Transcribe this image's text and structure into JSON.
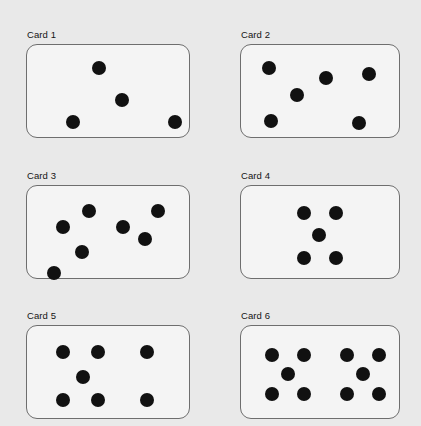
{
  "page": {
    "background_color": "#e9e9e9",
    "card_fill_color": "#f4f4f4",
    "card_border_color": "#6e6e6e",
    "dot_color": "#111111",
    "width": 421,
    "height": 426
  },
  "chart_data": {
    "type": "scatter",
    "title": "",
    "subtitle": "",
    "xlabel": "",
    "ylabel": "",
    "grid": false,
    "legend": null,
    "categories": [
      "Card 1",
      "Card 2",
      "Card 3",
      "Card 4",
      "Card 5",
      "Card 6"
    ],
    "values": [
      4,
      6,
      7,
      5,
      7,
      10
    ],
    "series": [
      {
        "name": "dot count per card",
        "values": [
          4,
          6,
          7,
          5,
          7,
          10
        ]
      }
    ],
    "dot_radius_px": 7
  },
  "cards": [
    {
      "label": "Card 1",
      "dot_count": 4,
      "box": {
        "x": 26,
        "y": 29,
        "w": 164,
        "h": 94
      },
      "dots": [
        {
          "cx": 72,
          "cy": 23
        },
        {
          "cx": 95,
          "cy": 55
        },
        {
          "cx": 46,
          "cy": 77
        },
        {
          "cx": 148,
          "cy": 77
        }
      ]
    },
    {
      "label": "Card 2",
      "dot_count": 6,
      "box": {
        "x": 240,
        "y": 29,
        "w": 160,
        "h": 94
      },
      "dots": [
        {
          "cx": 28,
          "cy": 23
        },
        {
          "cx": 56,
          "cy": 50
        },
        {
          "cx": 85,
          "cy": 33
        },
        {
          "cx": 128,
          "cy": 29
        },
        {
          "cx": 30,
          "cy": 76
        },
        {
          "cx": 118,
          "cy": 78
        }
      ]
    },
    {
      "label": "Card 3",
      "dot_count": 7,
      "box": {
        "x": 26,
        "y": 170,
        "w": 164,
        "h": 94
      },
      "dots": [
        {
          "cx": 62,
          "cy": 25
        },
        {
          "cx": 36,
          "cy": 41
        },
        {
          "cx": 55,
          "cy": 66
        },
        {
          "cx": 27,
          "cy": 87
        },
        {
          "cx": 96,
          "cy": 41
        },
        {
          "cx": 118,
          "cy": 53
        },
        {
          "cx": 131,
          "cy": 25
        }
      ]
    },
    {
      "label": "Card 4",
      "dot_count": 5,
      "box": {
        "x": 240,
        "y": 170,
        "w": 160,
        "h": 94
      },
      "dots": [
        {
          "cx": 63,
          "cy": 27
        },
        {
          "cx": 95,
          "cy": 27
        },
        {
          "cx": 78,
          "cy": 49
        },
        {
          "cx": 63,
          "cy": 72
        },
        {
          "cx": 95,
          "cy": 72
        }
      ]
    },
    {
      "label": "Card 5",
      "dot_count": 7,
      "box": {
        "x": 26,
        "y": 310,
        "w": 164,
        "h": 94
      },
      "dots": [
        {
          "cx": 36,
          "cy": 26
        },
        {
          "cx": 71,
          "cy": 26
        },
        {
          "cx": 120,
          "cy": 26
        },
        {
          "cx": 56,
          "cy": 51
        },
        {
          "cx": 36,
          "cy": 74
        },
        {
          "cx": 71,
          "cy": 74
        },
        {
          "cx": 120,
          "cy": 74
        }
      ]
    },
    {
      "label": "Card 6",
      "dot_count": 10,
      "box": {
        "x": 240,
        "y": 310,
        "w": 160,
        "h": 94
      },
      "dots": [
        {
          "cx": 31,
          "cy": 29
        },
        {
          "cx": 63,
          "cy": 29
        },
        {
          "cx": 47,
          "cy": 48
        },
        {
          "cx": 31,
          "cy": 68
        },
        {
          "cx": 63,
          "cy": 68
        },
        {
          "cx": 106,
          "cy": 29
        },
        {
          "cx": 138,
          "cy": 29
        },
        {
          "cx": 122,
          "cy": 48
        },
        {
          "cx": 106,
          "cy": 68
        },
        {
          "cx": 138,
          "cy": 68
        }
      ]
    }
  ]
}
